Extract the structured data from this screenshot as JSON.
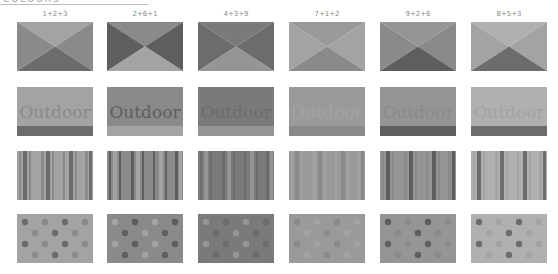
{
  "header": {
    "title_text": "COLOURS"
  },
  "columns": [
    {
      "label": "1+2+3",
      "c1": "#a3a3a3",
      "c2": "#8a8a8a",
      "c3": "#6c6c6c"
    },
    {
      "label": "2+6+1",
      "c1": "#8a8a8a",
      "c2": "#5e5e5e",
      "c3": "#a3a3a3"
    },
    {
      "label": "4+3+9",
      "c1": "#7a7a7a",
      "c2": "#6c6c6c",
      "c3": "#959595"
    },
    {
      "label": "7+1+2",
      "c1": "#9a9a9a",
      "c2": "#a3a3a3",
      "c3": "#8a8a8a"
    },
    {
      "label": "9+2+6",
      "c1": "#959595",
      "c2": "#8a8a8a",
      "c3": "#5e5e5e"
    },
    {
      "label": "8+5+3",
      "c1": "#b0b0b0",
      "c2": "#a3a3a3",
      "c3": "#6c6c6c"
    }
  ],
  "rows": [
    {
      "pattern": "triangles"
    },
    {
      "pattern": "outdoor",
      "text": "Outdoor"
    },
    {
      "pattern": "stripes"
    },
    {
      "pattern": "dots"
    }
  ]
}
